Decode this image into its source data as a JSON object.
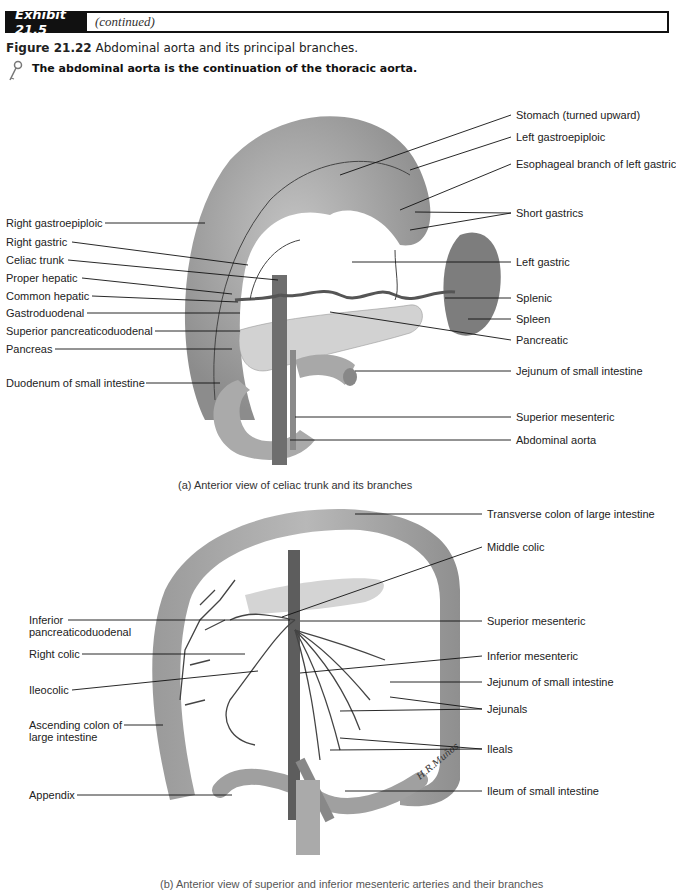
{
  "header": {
    "exhibit_label": "Exhibit 21.5",
    "continued": "(continued)"
  },
  "figure": {
    "number": "Figure 21.22",
    "title": "Abdominal aorta and its principal branches.",
    "key_note": "The abdominal aorta is the continuation of the thoracic aorta.",
    "key_icon": "key-icon"
  },
  "panel_a": {
    "caption": "(a) Anterior view of celiac trunk and its branches",
    "left_labels": [
      "Right gastroepiploic",
      "Right gastric",
      "Celiac trunk",
      "Proper hepatic",
      "Common hepatic",
      "Gastroduodenal",
      "Superior pancreaticoduodenal",
      "Pancreas",
      "Duodenum of small intestine"
    ],
    "right_labels": [
      "Stomach (turned upward)",
      "Left gastroepiploic",
      "Esophageal branch of left gastric",
      "Short gastrics",
      "Left gastric",
      "Splenic",
      "Spleen",
      "Pancreatic",
      "Jejunum of small intestine",
      "Superior mesenteric",
      "Abdominal aorta"
    ]
  },
  "panel_b": {
    "caption": "(b) Anterior view of superior and inferior mesenteric arteries and their branches",
    "left_labels": [
      "Inferior",
      "pancreaticoduodenal",
      "Right colic",
      "Ileocolic",
      "Ascending colon of",
      "large intestine",
      "Appendix"
    ],
    "right_labels": [
      "Transverse colon of large intestine",
      "Middle colic",
      "Superior mesenteric",
      "Inferior mesenteric",
      "Jejunum of small intestine",
      "Jejunals",
      "Ileals",
      "Ileum of small intestine"
    ],
    "signature": "H.R.Muños"
  }
}
